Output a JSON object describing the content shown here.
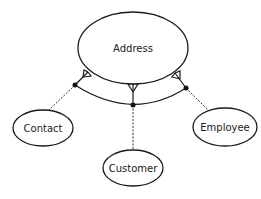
{
  "diagram": {
    "type": "entity-relationship",
    "entities": [
      {
        "id": "address",
        "label": "Address",
        "cx": 133,
        "cy": 48,
        "rx": 55,
        "ry": 36
      },
      {
        "id": "contact",
        "label": "Contact",
        "cx": 43,
        "cy": 128,
        "rx": 30,
        "ry": 18
      },
      {
        "id": "customer",
        "label": "Customer",
        "cx": 133,
        "cy": 168,
        "rx": 30,
        "ry": 18
      },
      {
        "id": "employee",
        "label": "Employee",
        "cx": 225,
        "cy": 127,
        "rx": 32,
        "ry": 19
      }
    ],
    "relationships": [
      {
        "from": "contact",
        "to": "address",
        "style": "dashed",
        "cardinality_to": "many"
      },
      {
        "from": "customer",
        "to": "address",
        "style": "dashed",
        "cardinality_to": "many"
      },
      {
        "from": "employee",
        "to": "address",
        "style": "dashed",
        "cardinality_to": "many"
      }
    ],
    "exclusive_arc": true,
    "colors": {
      "stroke": "#1a1a1a",
      "background": "#ffffff"
    }
  }
}
